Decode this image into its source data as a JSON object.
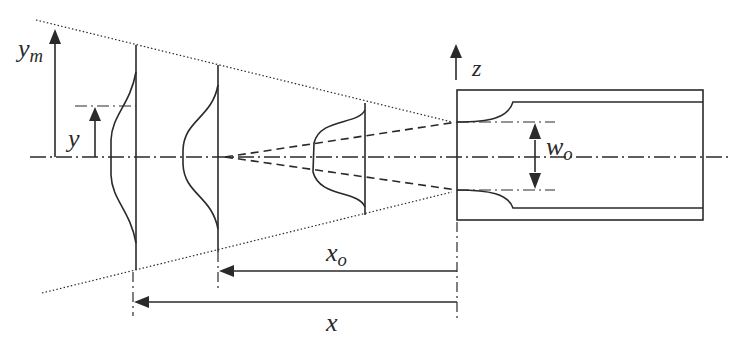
{
  "figure": {
    "type": "schematic"
  },
  "colors": {
    "stroke": "#2a2a2a",
    "background": "#ffffff"
  },
  "labels": {
    "y_m": {
      "base": "y",
      "sub": "m"
    },
    "y": {
      "base": "y"
    },
    "z": {
      "base": "z"
    },
    "w_o": {
      "base": "w",
      "sub": "o"
    },
    "x_o": {
      "base": "x",
      "sub": "o"
    },
    "x": {
      "base": "x"
    }
  },
  "elements": {
    "centerline": "dash-dot axis of symmetry",
    "spread_boundary": "dotted lines diverging from nozzle exit",
    "core_boundary": "dashed lines converging to virtual origin",
    "profiles": [
      "far-field velocity profile",
      "mid velocity profile",
      "near-nozzle velocity profile"
    ],
    "nozzle": "rectangular nozzle with contracted inlet",
    "dimensions": [
      "y_m (max half-width)",
      "y (lateral coordinate)",
      "w_o (nozzle width)",
      "x_o (virtual origin offset)",
      "x (downstream distance)"
    ]
  }
}
